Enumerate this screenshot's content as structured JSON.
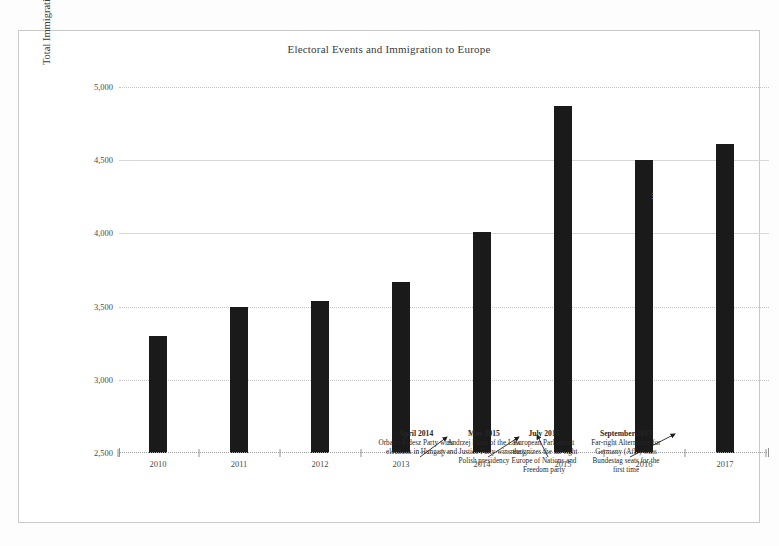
{
  "chart_data": {
    "type": "bar",
    "title": "Electoral Events and Immigration to Europe",
    "xlabel": "",
    "ylabel": "Total Immigration to European Countries, Thousands",
    "categories": [
      "2010",
      "2011",
      "2012",
      "2013",
      "2014",
      "2015",
      "2016",
      "2017"
    ],
    "values": [
      3300,
      3500,
      3540,
      3670,
      4010,
      4870,
      4500,
      4610
    ],
    "ylim": [
      2500,
      5000
    ],
    "yticks": [
      "2,500",
      "3,000",
      "3,500",
      "4,000",
      "4,500",
      "5,000"
    ],
    "ytick_values": [
      2500,
      3000,
      3500,
      4000,
      4500,
      5000
    ],
    "grid": true,
    "legend": "none",
    "bar_color": "#1a1a1a",
    "annotations": [
      {
        "date": "April 2014",
        "text": "Orban's Fidesz Party wins elections in Hungary",
        "points_to": "2014"
      },
      {
        "date": "May 2015",
        "text": "Andrzej Duda of the Law and Justice Party wins the Polish presidency",
        "points_to": "2015"
      },
      {
        "date": "July 2015",
        "text": "European Parliament recognizes the far-right Europe of Nations and Freedom party",
        "points_to": "2015"
      },
      {
        "date": "September 2017",
        "text": "Far-right Alternative for Germany (AfD) wins Bundestag seats for the first time",
        "points_to": "2017"
      }
    ]
  }
}
